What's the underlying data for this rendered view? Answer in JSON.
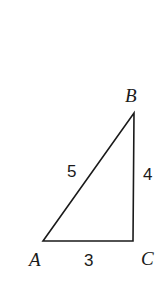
{
  "figure": {
    "kind": "right-triangle-diagram",
    "background_color": "#ffffff",
    "stroke_color": "#1a1a1a",
    "stroke_width": 1.6,
    "vertices": {
      "A": {
        "label": "A",
        "x": 43,
        "y": 241
      },
      "B": {
        "label": "B",
        "x": 134,
        "y": 113
      },
      "C": {
        "label": "C",
        "x": 133,
        "y": 241
      }
    },
    "sides": {
      "AB": {
        "label": "5",
        "name": "hypotenuse"
      },
      "BC": {
        "label": "4",
        "name": "vertical-leg"
      },
      "AC": {
        "label": "3",
        "name": "horizontal-leg"
      }
    }
  },
  "chart_data": {
    "type": "diagram",
    "title": "",
    "categories": [
      "AB",
      "BC",
      "AC"
    ],
    "values": [
      5,
      4,
      3
    ],
    "labels": [
      "5",
      "4",
      "3"
    ],
    "vertex_labels": [
      "A",
      "B",
      "C"
    ]
  }
}
